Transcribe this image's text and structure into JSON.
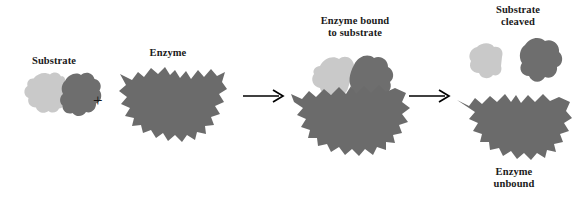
{
  "figure": {
    "background_color": "#ffffff",
    "text_color": "#1a1a1a",
    "colors": {
      "substrate_light": "#c9c9c9",
      "substrate_dark": "#6e6e6e",
      "enzyme": "#6b6b6b",
      "arrow": "#000000",
      "plus": "#161616"
    }
  },
  "labels": {
    "substrate": "Substrate",
    "enzyme": "Enzyme",
    "bound": "Enzyme bound\nto substrate",
    "cleaved": "Substrate\ncleaved",
    "unbound": "Enzyme\nunbound"
  },
  "operators": {
    "plus": "+",
    "arrow1": "→",
    "arrow2": "→"
  },
  "stages": [
    {
      "name": "substrate",
      "label": "Substrate",
      "parts": [
        "substrate-light-lobe",
        "substrate-dark-lobe"
      ]
    },
    {
      "name": "enzyme",
      "label": "Enzyme",
      "parts": [
        "enzyme-body"
      ]
    },
    {
      "name": "enzyme-bound-to-substrate",
      "label": "Enzyme bound to substrate",
      "parts": [
        "substrate-light-lobe",
        "substrate-dark-lobe",
        "enzyme-body"
      ]
    },
    {
      "name": "products",
      "label": "Substrate cleaved / Enzyme unbound",
      "parts": [
        "substrate-light-lobe",
        "substrate-dark-lobe",
        "enzyme-body"
      ]
    }
  ]
}
